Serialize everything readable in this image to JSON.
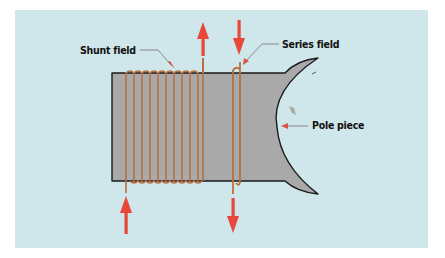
{
  "diagram": {
    "labels": {
      "shunt_field": "Shunt field",
      "series_field": "Series field",
      "pole_piece": "Pole piece"
    },
    "colors": {
      "background_panel": "#cfe6ea",
      "core_fill": "#a9a9a9",
      "core_outline": "#1a1a1a",
      "coil_wire": "#b8703f",
      "arrow": "#e8473a",
      "leader_line": "#8a8a8a",
      "leader_arrowhead": "#d9534a"
    },
    "shunt_coil": {
      "turns": 10,
      "current_in_direction": "up (bottom lead)",
      "current_out_direction": "up (top lead)"
    },
    "series_coil": {
      "turns": 2,
      "current_in_direction": "down (top lead)",
      "current_out_direction": "down (bottom lead)"
    }
  }
}
